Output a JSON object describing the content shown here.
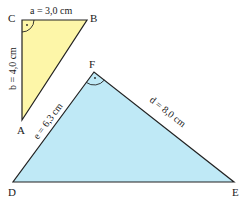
{
  "colors": {
    "triangle1_fill": "#fdf6a8",
    "triangle2_fill": "#bfe9f6",
    "stroke": "#222222"
  },
  "triangle1": {
    "vertices": {
      "C": "C",
      "B": "B",
      "A": "A"
    },
    "right_angle_at": "C",
    "sides": {
      "a": "a = 3,0 cm",
      "b": "b = 4,0 cm"
    }
  },
  "triangle2": {
    "vertices": {
      "F": "F",
      "D": "D",
      "E": "E"
    },
    "right_angle_at": "F",
    "sides": {
      "e": "e = 6,3 cm",
      "d": "d = 8,0 cm"
    }
  }
}
